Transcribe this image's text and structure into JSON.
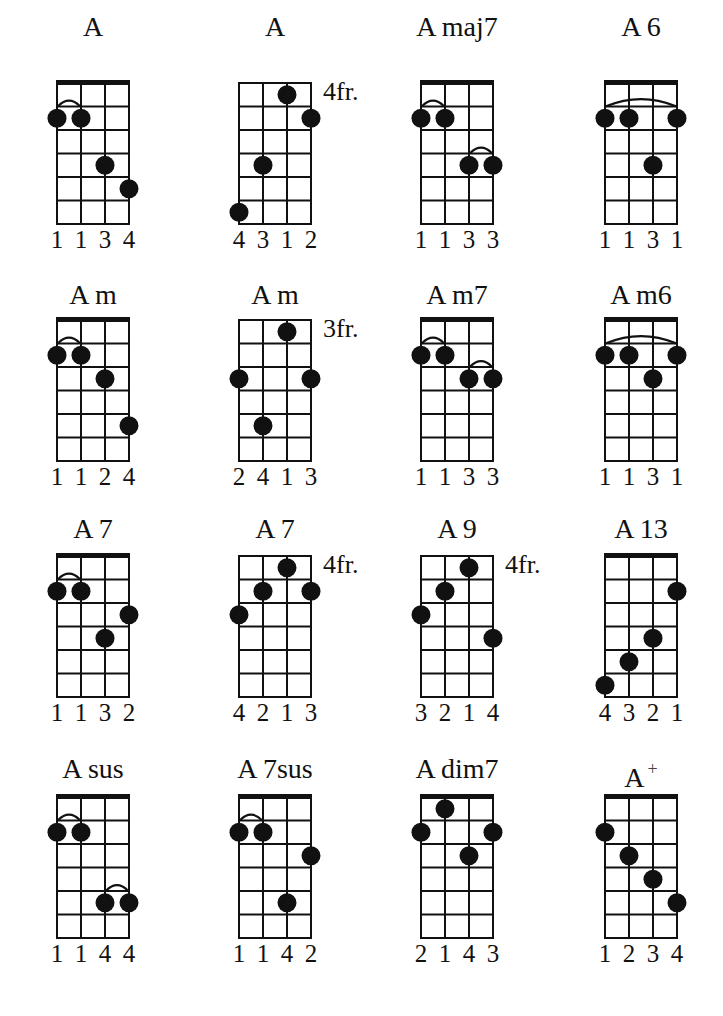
{
  "title": "",
  "chord_chart": {
    "strings": 4,
    "frets_shown": 6,
    "colors": {
      "ink": "#111111",
      "paper": "#ffffff"
    },
    "chords": [
      {
        "name": "A",
        "suffix": "",
        "nut": true,
        "fret_label": "",
        "dots": [
          [
            1,
            2
          ],
          [
            2,
            2
          ],
          [
            3,
            4
          ],
          [
            4,
            5
          ]
        ],
        "barres": [
          [
            1,
            2,
            2
          ]
        ],
        "fingers": [
          "1",
          "1",
          "3",
          "4"
        ]
      },
      {
        "name": "A",
        "suffix": "",
        "nut": false,
        "fret_label": "4fr.",
        "dots": [
          [
            3,
            1
          ],
          [
            4,
            2
          ],
          [
            2,
            4
          ],
          [
            1,
            6
          ]
        ],
        "barres": [],
        "fingers": [
          "4",
          "3",
          "1",
          "2"
        ]
      },
      {
        "name": "A maj7",
        "suffix": "",
        "nut": true,
        "fret_label": "",
        "dots": [
          [
            1,
            2
          ],
          [
            2,
            2
          ],
          [
            3,
            4
          ],
          [
            4,
            4
          ]
        ],
        "barres": [
          [
            1,
            2,
            2
          ],
          [
            3,
            4,
            4
          ]
        ],
        "fingers": [
          "1",
          "1",
          "3",
          "3"
        ]
      },
      {
        "name": "A 6",
        "suffix": "",
        "nut": true,
        "fret_label": "",
        "dots": [
          [
            1,
            2
          ],
          [
            2,
            2
          ],
          [
            4,
            2
          ],
          [
            3,
            4
          ]
        ],
        "barres": [
          [
            1,
            4,
            2
          ]
        ],
        "fingers": [
          "1",
          "1",
          "3",
          "1"
        ]
      },
      {
        "name": "A m",
        "suffix": "",
        "nut": true,
        "fret_label": "",
        "dots": [
          [
            1,
            2
          ],
          [
            2,
            2
          ],
          [
            3,
            3
          ],
          [
            4,
            5
          ]
        ],
        "barres": [
          [
            1,
            2,
            2
          ]
        ],
        "fingers": [
          "1",
          "1",
          "2",
          "4"
        ]
      },
      {
        "name": "A m",
        "suffix": "",
        "nut": false,
        "fret_label": "3fr.",
        "dots": [
          [
            3,
            1
          ],
          [
            1,
            3
          ],
          [
            4,
            3
          ],
          [
            2,
            5
          ]
        ],
        "barres": [],
        "fingers": [
          "2",
          "4",
          "1",
          "3"
        ]
      },
      {
        "name": "A m7",
        "suffix": "",
        "nut": true,
        "fret_label": "",
        "dots": [
          [
            1,
            2
          ],
          [
            2,
            2
          ],
          [
            3,
            3
          ],
          [
            4,
            3
          ]
        ],
        "barres": [
          [
            1,
            2,
            2
          ],
          [
            3,
            4,
            3
          ]
        ],
        "fingers": [
          "1",
          "1",
          "3",
          "3"
        ]
      },
      {
        "name": "A m6",
        "suffix": "",
        "nut": true,
        "fret_label": "",
        "dots": [
          [
            1,
            2
          ],
          [
            2,
            2
          ],
          [
            4,
            2
          ],
          [
            3,
            3
          ]
        ],
        "barres": [
          [
            1,
            4,
            2
          ]
        ],
        "fingers": [
          "1",
          "1",
          "3",
          "1"
        ]
      },
      {
        "name": "A 7",
        "suffix": "",
        "nut": true,
        "fret_label": "",
        "dots": [
          [
            1,
            2
          ],
          [
            2,
            2
          ],
          [
            4,
            3
          ],
          [
            3,
            4
          ]
        ],
        "barres": [
          [
            1,
            2,
            2
          ]
        ],
        "fingers": [
          "1",
          "1",
          "3",
          "2"
        ]
      },
      {
        "name": "A 7",
        "suffix": "",
        "nut": false,
        "fret_label": "4fr.",
        "dots": [
          [
            3,
            1
          ],
          [
            2,
            2
          ],
          [
            4,
            2
          ],
          [
            1,
            3
          ]
        ],
        "barres": [],
        "fingers": [
          "4",
          "2",
          "1",
          "3"
        ]
      },
      {
        "name": "A 9",
        "suffix": "",
        "nut": false,
        "fret_label": "4fr.",
        "dots": [
          [
            3,
            1
          ],
          [
            2,
            2
          ],
          [
            1,
            3
          ],
          [
            4,
            4
          ]
        ],
        "barres": [],
        "fingers": [
          "3",
          "2",
          "1",
          "4"
        ]
      },
      {
        "name": "A 13",
        "suffix": "",
        "nut": true,
        "fret_label": "",
        "dots": [
          [
            4,
            2
          ],
          [
            3,
            4
          ],
          [
            2,
            5
          ],
          [
            1,
            6
          ]
        ],
        "barres": [],
        "fingers": [
          "4",
          "3",
          "2",
          "1"
        ]
      },
      {
        "name": "A sus",
        "suffix": "",
        "nut": true,
        "fret_label": "",
        "dots": [
          [
            1,
            2
          ],
          [
            2,
            2
          ],
          [
            3,
            5
          ],
          [
            4,
            5
          ]
        ],
        "barres": [
          [
            1,
            2,
            2
          ],
          [
            3,
            4,
            5
          ]
        ],
        "fingers": [
          "1",
          "1",
          "4",
          "4"
        ]
      },
      {
        "name": "A 7sus",
        "suffix": "",
        "nut": true,
        "fret_label": "",
        "dots": [
          [
            1,
            2
          ],
          [
            2,
            2
          ],
          [
            4,
            3
          ],
          [
            3,
            5
          ]
        ],
        "barres": [
          [
            1,
            2,
            2
          ]
        ],
        "fingers": [
          "1",
          "1",
          "4",
          "2"
        ]
      },
      {
        "name": "A dim7",
        "suffix": "",
        "nut": true,
        "fret_label": "",
        "dots": [
          [
            2,
            1
          ],
          [
            1,
            2
          ],
          [
            4,
            2
          ],
          [
            3,
            3
          ]
        ],
        "barres": [],
        "fingers": [
          "2",
          "1",
          "4",
          "3"
        ]
      },
      {
        "name": "A",
        "suffix": "+",
        "nut": true,
        "fret_label": "",
        "dots": [
          [
            1,
            2
          ],
          [
            2,
            3
          ],
          [
            3,
            4
          ],
          [
            4,
            5
          ]
        ],
        "barres": [],
        "fingers": [
          "1",
          "2",
          "3",
          "4"
        ]
      }
    ]
  }
}
